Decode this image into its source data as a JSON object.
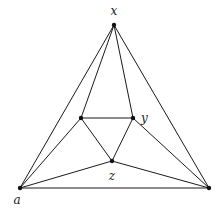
{
  "diagram": {
    "type": "planar-graph",
    "nodes": [
      {
        "id": "x",
        "label": "x"
      },
      {
        "id": "a",
        "label": "a"
      },
      {
        "id": "b",
        "label": ""
      },
      {
        "id": "p",
        "label": ""
      },
      {
        "id": "y",
        "label": "y"
      },
      {
        "id": "z",
        "label": "z"
      }
    ],
    "edges": [
      [
        "x",
        "a"
      ],
      [
        "x",
        "b"
      ],
      [
        "a",
        "b"
      ],
      [
        "x",
        "p"
      ],
      [
        "x",
        "y"
      ],
      [
        "p",
        "y"
      ],
      [
        "p",
        "z"
      ],
      [
        "y",
        "z"
      ],
      [
        "a",
        "p"
      ],
      [
        "a",
        "z"
      ],
      [
        "b",
        "y"
      ],
      [
        "b",
        "z"
      ]
    ]
  }
}
